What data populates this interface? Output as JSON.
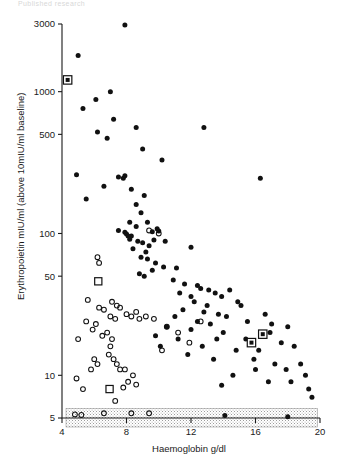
{
  "header": {
    "faint_text": "Published research"
  },
  "chart_data": {
    "type": "scatter",
    "title": "",
    "xlabel": "Haemoglobin g/dl",
    "ylabel": "Erythropoietin mIU/ml (above 10mIU/ml baseline)",
    "xlim": [
      4,
      20
    ],
    "ylim": [
      5,
      3000
    ],
    "yscale": "log",
    "xscale": "linear",
    "grid": false,
    "legend": "none",
    "xticks": [
      4,
      8,
      12,
      16,
      20
    ],
    "xtick_labels": [
      "4",
      "8",
      "12",
      "16",
      "20"
    ],
    "yticks": [
      5,
      10,
      50,
      100,
      500,
      1000,
      3000
    ],
    "ytick_labels": [
      "5",
      "10",
      "50",
      "100",
      "500",
      "1000",
      "3000"
    ],
    "annotations": [
      {
        "name": "detection-limit-band",
        "type": "shaded-band",
        "y_from": 5,
        "y_to": 5.85,
        "x_from": 4.25,
        "x_to": 19.85,
        "style": "stippled-grey"
      }
    ],
    "series": [
      {
        "name": "filled-circle",
        "marker": "filled circle",
        "color": "#111111",
        "points": [
          [
            7.9,
            2950
          ],
          [
            5.0,
            1800
          ],
          [
            5.3,
            760
          ],
          [
            6.1,
            880
          ],
          [
            7.0,
            1000
          ],
          [
            7.2,
            640
          ],
          [
            6.2,
            520
          ],
          [
            6.8,
            470
          ],
          [
            8.6,
            560
          ],
          [
            9.0,
            395
          ],
          [
            4.9,
            260
          ],
          [
            10.2,
            330
          ],
          [
            12.8,
            560
          ],
          [
            7.5,
            250
          ],
          [
            7.8,
            245
          ],
          [
            7.9,
            255
          ],
          [
            8.3,
            205
          ],
          [
            5.5,
            175
          ],
          [
            6.6,
            215
          ],
          [
            8.6,
            160
          ],
          [
            9.1,
            185
          ],
          [
            8.9,
            140
          ],
          [
            16.3,
            245
          ],
          [
            8.2,
            120
          ],
          [
            8.6,
            112
          ],
          [
            7.5,
            105
          ],
          [
            7.9,
            102
          ],
          [
            8.0,
            99
          ],
          [
            8.3,
            96
          ],
          [
            9.3,
            120
          ],
          [
            9.6,
            103
          ],
          [
            9.9,
            108
          ],
          [
            10.0,
            104
          ],
          [
            8.7,
            88
          ],
          [
            9.0,
            86
          ],
          [
            9.4,
            82
          ],
          [
            8.4,
            78
          ],
          [
            9.2,
            74
          ],
          [
            8.1,
            96
          ],
          [
            8.2,
            91
          ],
          [
            9.7,
            90
          ],
          [
            10.4,
            88
          ],
          [
            8.9,
            68
          ],
          [
            9.3,
            66
          ],
          [
            12.0,
            80
          ],
          [
            9.8,
            62
          ],
          [
            10.3,
            58
          ],
          [
            9.6,
            55
          ],
          [
            11.1,
            57
          ],
          [
            8.8,
            52
          ],
          [
            9.1,
            50
          ],
          [
            10.9,
            47
          ],
          [
            11.6,
            44
          ],
          [
            12.4,
            43
          ],
          [
            12.6,
            41
          ],
          [
            13.1,
            40
          ],
          [
            11.3,
            38
          ],
          [
            12.0,
            36
          ],
          [
            13.5,
            38
          ],
          [
            13.9,
            36
          ],
          [
            14.4,
            40
          ],
          [
            12.2,
            33
          ],
          [
            13.0,
            31
          ],
          [
            14.9,
            33
          ],
          [
            15.1,
            31
          ],
          [
            11.5,
            29
          ],
          [
            12.8,
            28
          ],
          [
            13.7,
            27
          ],
          [
            14.2,
            26
          ],
          [
            16.6,
            27
          ],
          [
            11.0,
            26
          ],
          [
            12.4,
            24
          ],
          [
            13.2,
            23
          ],
          [
            15.5,
            24
          ],
          [
            17.0,
            23
          ],
          [
            10.5,
            22
          ],
          [
            12.0,
            21
          ],
          [
            14.0,
            20
          ],
          [
            16.9,
            20
          ],
          [
            18.0,
            22
          ],
          [
            9.8,
            19
          ],
          [
            11.2,
            18
          ],
          [
            13.6,
            18
          ],
          [
            15.4,
            18
          ],
          [
            17.6,
            17
          ],
          [
            10.1,
            16
          ],
          [
            12.7,
            16
          ],
          [
            14.8,
            15
          ],
          [
            16.2,
            15
          ],
          [
            18.4,
            16
          ],
          [
            11.8,
            14
          ],
          [
            13.4,
            13
          ],
          [
            15.9,
            13
          ],
          [
            17.2,
            12
          ],
          [
            18.8,
            12
          ],
          [
            16.0,
            11
          ],
          [
            17.9,
            11
          ],
          [
            19.1,
            10
          ],
          [
            14.6,
            10
          ],
          [
            18.2,
            9
          ],
          [
            19.3,
            8
          ],
          [
            16.8,
            9
          ],
          [
            13.9,
            8.5
          ],
          [
            19.5,
            7
          ],
          [
            14.1,
            5.2
          ],
          [
            18.0,
            5.1
          ]
        ]
      },
      {
        "name": "open-circle",
        "marker": "open circle",
        "color": "#111111",
        "points": [
          [
            9.4,
            105
          ],
          [
            6.2,
            68
          ],
          [
            6.3,
            62
          ],
          [
            10.0,
            100
          ],
          [
            5.6,
            34
          ],
          [
            6.3,
            30
          ],
          [
            6.6,
            29
          ],
          [
            5.5,
            24
          ],
          [
            6.1,
            23
          ],
          [
            5.9,
            21
          ],
          [
            6.8,
            20
          ],
          [
            7.1,
            33
          ],
          [
            7.4,
            31
          ],
          [
            7.6,
            30
          ],
          [
            7.0,
            26
          ],
          [
            7.3,
            25
          ],
          [
            8.0,
            27
          ],
          [
            8.3,
            26
          ],
          [
            8.6,
            28
          ],
          [
            8.8,
            25
          ],
          [
            9.2,
            26
          ],
          [
            5.0,
            18
          ],
          [
            6.5,
            19
          ],
          [
            7.1,
            18
          ],
          [
            7.0,
            16
          ],
          [
            6.9,
            14
          ],
          [
            7.2,
            13
          ],
          [
            7.4,
            12
          ],
          [
            6.0,
            13
          ],
          [
            6.2,
            12
          ],
          [
            5.8,
            11
          ],
          [
            7.6,
            11
          ],
          [
            7.9,
            11
          ],
          [
            8.4,
            10
          ],
          [
            9.7,
            25
          ],
          [
            10.5,
            22
          ],
          [
            11.2,
            20
          ],
          [
            11.9,
            17
          ],
          [
            12.6,
            24
          ],
          [
            10.2,
            15
          ],
          [
            8.1,
            9
          ],
          [
            8.6,
            8.6
          ],
          [
            7.8,
            8.2
          ],
          [
            4.9,
            9.5
          ],
          [
            5.3,
            8.0
          ],
          [
            7.3,
            6.6
          ],
          [
            4.8,
            5.3
          ],
          [
            5.2,
            5.25
          ],
          [
            6.6,
            5.4
          ],
          [
            8.3,
            5.4
          ],
          [
            9.4,
            5.4
          ]
        ]
      },
      {
        "name": "filled-square-highlight",
        "marker": "filled square in open square",
        "color": "#111111",
        "points": [
          [
            4.35,
            1210
          ],
          [
            15.75,
            17.0
          ],
          [
            16.45,
            19.5
          ]
        ]
      },
      {
        "name": "open-square-highlight",
        "marker": "open square",
        "color": "#111111",
        "points": [
          [
            6.25,
            46
          ],
          [
            6.95,
            8.0
          ]
        ]
      }
    ]
  }
}
